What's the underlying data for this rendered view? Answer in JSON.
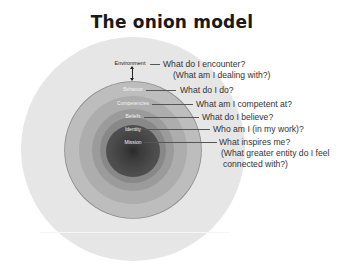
{
  "title": "The onion model",
  "layers": [
    {
      "name": "Environment",
      "question": "What do I encounter?",
      "sub_question": "(What am I dealing with?)"
    },
    {
      "name": "Behavior",
      "question": "What do I do?"
    },
    {
      "name": "Competencies",
      "question": "What am I competent at?"
    },
    {
      "name": "Beliefs",
      "question": "What do I believe?"
    },
    {
      "name": "Identity",
      "question": "Who am I (in my work)?"
    },
    {
      "name": "Mission",
      "question": "What inspires me?",
      "sub_question": "(What greater entity do I feel",
      "sub_question_2": "connected with?)"
    }
  ],
  "colors": {
    "environment": "#e6e6e6",
    "behavior": "#bdbdbd",
    "competencies": "#adadad",
    "beliefs": "#9b9b9b",
    "identity": "#888888",
    "mission": "#4a4a4a",
    "core": "#2a2a2a"
  }
}
